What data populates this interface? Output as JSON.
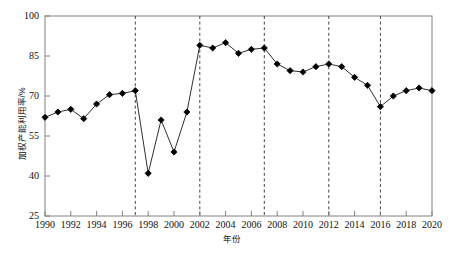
{
  "chart_data": {
    "type": "line",
    "title": "",
    "xlabel": "年份",
    "ylabel": "加权产能利用率/%",
    "xlim": [
      1990,
      2020
    ],
    "ylim": [
      25,
      100
    ],
    "grid": false,
    "legend": "none",
    "marker": "filled-diamond",
    "line_color": "#1a1a1a",
    "marker_color": "#000000",
    "axis_color": "#808080",
    "xticks": [
      1990,
      1992,
      1994,
      1996,
      1998,
      2000,
      2002,
      2004,
      2006,
      2008,
      2010,
      2012,
      2014,
      2016,
      2018,
      2020
    ],
    "xtick_labels": [
      "1990",
      "1992",
      "1994",
      "1996",
      "1998",
      "2000",
      "2002",
      "2004",
      "2006",
      "2008",
      "2010",
      "2012",
      "2014",
      "2016",
      "2018",
      "2020"
    ],
    "yticks": [
      25,
      40,
      55,
      70,
      85,
      100
    ],
    "ytick_labels": [
      "25",
      "40",
      "55",
      "70",
      "85",
      "100"
    ],
    "x": [
      1990,
      1991,
      1992,
      1993,
      1994,
      1995,
      1996,
      1997,
      1998,
      1999,
      2000,
      2001,
      2002,
      2003,
      2004,
      2005,
      2006,
      2007,
      2008,
      2009,
      2010,
      2011,
      2012,
      2013,
      2014,
      2015,
      2016,
      2017,
      2018,
      2019,
      2020
    ],
    "values": [
      62.0,
      64.0,
      65.0,
      61.5,
      67.0,
      70.5,
      71.0,
      72.0,
      41.0,
      61.0,
      49.0,
      64.0,
      89.0,
      88.0,
      90.0,
      86.0,
      87.5,
      88.0,
      82.0,
      79.5,
      79.0,
      81.0,
      82.0,
      81.0,
      77.0,
      74.0,
      66.0,
      70.0,
      72.0,
      73.0,
      72.0
    ],
    "vertical_dashed_lines": [
      1997,
      2002,
      2007,
      2012,
      2016
    ],
    "vline_color": "#444444"
  },
  "caption": {
    "text": ""
  }
}
